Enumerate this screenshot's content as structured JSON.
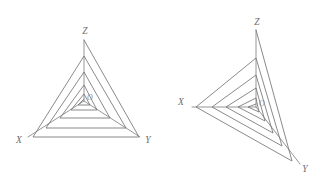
{
  "canvas": {
    "width": 329,
    "height": 189,
    "background": "#ffffff",
    "line_color": "#757575",
    "axis_color": "#8a8a8a",
    "label_color": "#6e6e6e"
  },
  "figures": [
    {
      "id": "left",
      "name": "symmetric-triangular-spiral",
      "view": "front",
      "origin": {
        "x": 84,
        "y": 101
      },
      "axes": [
        {
          "name": "X",
          "label": "X",
          "label_x": 19,
          "label_y": 143,
          "end_x": 28,
          "end_y": 137
        },
        {
          "name": "Y",
          "label": "Y",
          "label_x": 148,
          "label_y": 143,
          "end_x": 140,
          "end_y": 137
        },
        {
          "name": "Z",
          "label": "Z",
          "label_x": 85,
          "label_y": 34,
          "end_x": 84,
          "end_y": 40
        }
      ],
      "origin_label": "O",
      "origin_label_x": 87,
      "origin_label_y": 100,
      "turns": 5,
      "spiral_points": [
        [
          84,
          99
        ],
        [
          78,
          105
        ],
        [
          90,
          105
        ],
        [
          84,
          94
        ],
        [
          71,
          110
        ],
        [
          97,
          110
        ],
        [
          84,
          85
        ],
        [
          60,
          118
        ],
        [
          110,
          118
        ],
        [
          84,
          72
        ],
        [
          46,
          128
        ],
        [
          126,
          128
        ],
        [
          84,
          56
        ],
        [
          33,
          137
        ],
        [
          139,
          137
        ],
        [
          84,
          40
        ]
      ]
    },
    {
      "id": "right",
      "name": "oblique-triangular-spiral",
      "view": "oblique",
      "origin": {
        "x": 256,
        "y": 107
      },
      "axes": [
        {
          "name": "X",
          "label": "X",
          "label_x": 181,
          "label_y": 105,
          "end_x": 192,
          "end_y": 107
        },
        {
          "name": "Y",
          "label": "Y",
          "label_x": 305,
          "label_y": 172,
          "end_x": 300,
          "end_y": 164
        },
        {
          "name": "Z",
          "label": "Z",
          "label_x": 257,
          "label_y": 25,
          "end_x": 256,
          "end_y": 30
        }
      ],
      "origin_label": "O",
      "origin_label_x": 259,
      "origin_label_y": 106,
      "turns": 5,
      "spiral_points": [
        [
          256,
          104
        ],
        [
          248,
          107
        ],
        [
          259,
          112
        ],
        [
          256,
          98
        ],
        [
          238,
          107
        ],
        [
          265,
          121
        ],
        [
          256,
          88
        ],
        [
          226,
          107
        ],
        [
          273,
          133
        ],
        [
          256,
          75
        ],
        [
          212,
          107
        ],
        [
          282,
          146
        ],
        [
          256,
          58
        ],
        [
          196,
          107
        ],
        [
          292,
          161
        ],
        [
          256,
          30
        ]
      ]
    }
  ],
  "labels": {
    "x_axis": "X",
    "y_axis": "Y",
    "z_axis": "Z",
    "origin": "O"
  }
}
